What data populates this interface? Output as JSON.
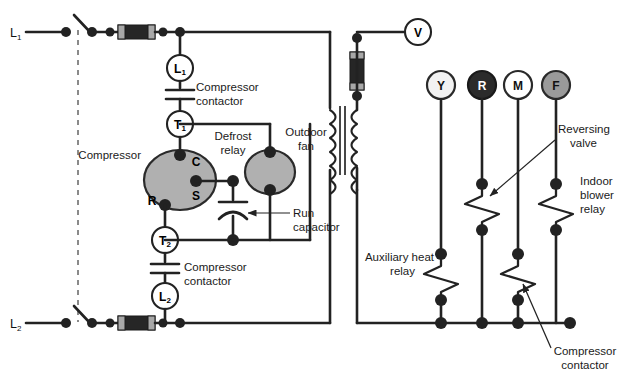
{
  "diagram": {
    "line_labels": {
      "l1": "L",
      "l1_sub": "1",
      "l2": "L",
      "l2_sub": "2"
    },
    "components": {
      "contactor_l1": {
        "letter": "L",
        "sub": "1"
      },
      "contactor_l2": {
        "letter": "L",
        "sub": "2"
      },
      "terminal_t1": {
        "letter": "T",
        "sub": "1"
      },
      "terminal_t2": {
        "letter": "T",
        "sub": "2"
      },
      "voltmeter": "V",
      "compressor_terminals": {
        "common": "C",
        "start": "S",
        "run": "R"
      }
    },
    "labels": {
      "compressor": "Compressor",
      "compressor_contactor_top": "Compressor\ncontactor",
      "compressor_contactor_top_line1": "Compressor",
      "compressor_contactor_top_line2": "contactor",
      "compressor_contactor_bottom_line1": "Compressor",
      "compressor_contactor_bottom_line2": "contactor",
      "defrost_relay_line1": "Defrost",
      "defrost_relay_line2": "relay",
      "outdoor_fan_line1": "Outdoor",
      "outdoor_fan_line2": "fan",
      "run_capacitor_line1": "Run",
      "run_capacitor_line2": "capacitor",
      "reversing_valve_line1": "Reversing",
      "reversing_valve_line2": "valve",
      "indoor_blower_relay_line1": "Indoor",
      "indoor_blower_relay_line2": "blower",
      "indoor_blower_relay_line3": "relay",
      "auxiliary_heat_relay_line1": "Auxiliary heat",
      "auxiliary_heat_relay_line2": "relay",
      "compressor_contactor_low_line1": "Compressor",
      "compressor_contactor_low_line2": "contactor"
    },
    "thermostat_terminals": [
      {
        "label": "Y",
        "fill": "#f2f2f2",
        "text_color": "#111111"
      },
      {
        "label": "R",
        "fill": "#2b2b2b",
        "text_color": "#ffffff"
      },
      {
        "label": "M",
        "fill": "#ffffff",
        "text_color": "#111111"
      },
      {
        "label": "F",
        "fill": "#9a9a9a",
        "text_color": "#111111"
      }
    ],
    "colors": {
      "wire": "#222222",
      "background": "#ffffff",
      "motor_fill": "#b0b0b0",
      "fuse_body": "#262626",
      "fuse_cap": "#a8a8a8",
      "dashed_divider": "#8a8a8a",
      "text": "#1a1a1a"
    },
    "icon_names": {
      "fuse": "fuse-icon",
      "disconnect_switch": "disconnect-switch-icon",
      "capacitor": "capacitor-icon",
      "run_capacitor": "run-capacitor-icon",
      "transformer": "transformer-icon",
      "relay_coil": "relay-coil-icon",
      "motor": "motor-icon",
      "voltmeter": "voltmeter-icon",
      "junction_node": "junction-node-icon",
      "arrow": "arrow-icon"
    }
  }
}
